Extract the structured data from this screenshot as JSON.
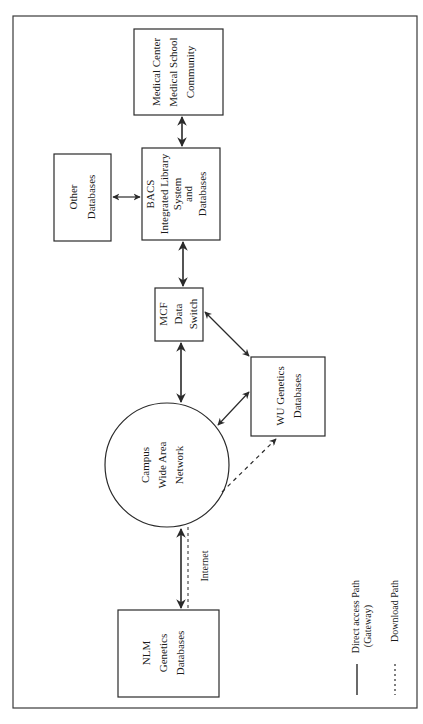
{
  "diagram": {
    "orientation": "rotated-90-clockwise",
    "nodes": {
      "medical_center": {
        "lines": [
          "Medical Center",
          "Medical School",
          "Community"
        ]
      },
      "other_db": {
        "lines": [
          "Other",
          "Databases"
        ]
      },
      "bacs": {
        "lines": [
          "BACS",
          "Integrated Library",
          "System",
          "and",
          "Databases"
        ]
      },
      "mcf": {
        "lines": [
          "MCF",
          "Data",
          "Switch"
        ]
      },
      "wu_genetics": {
        "lines": [
          "WU Genetics",
          "Databases"
        ]
      },
      "campus_wan": {
        "lines": [
          "Campus",
          "Wide Area",
          "Network"
        ]
      },
      "nlm": {
        "lines": [
          "NLM",
          "Genetics",
          "Databases"
        ]
      }
    },
    "edge_labels": {
      "internet": "Internet"
    },
    "legend": {
      "solid": {
        "lines": [
          "Direct access Path",
          "(Gateway)"
        ]
      },
      "dashed": {
        "lines": [
          "Download Path"
        ]
      }
    },
    "colors": {
      "stroke": "#2a2a2a",
      "background": "#ffffff"
    }
  }
}
